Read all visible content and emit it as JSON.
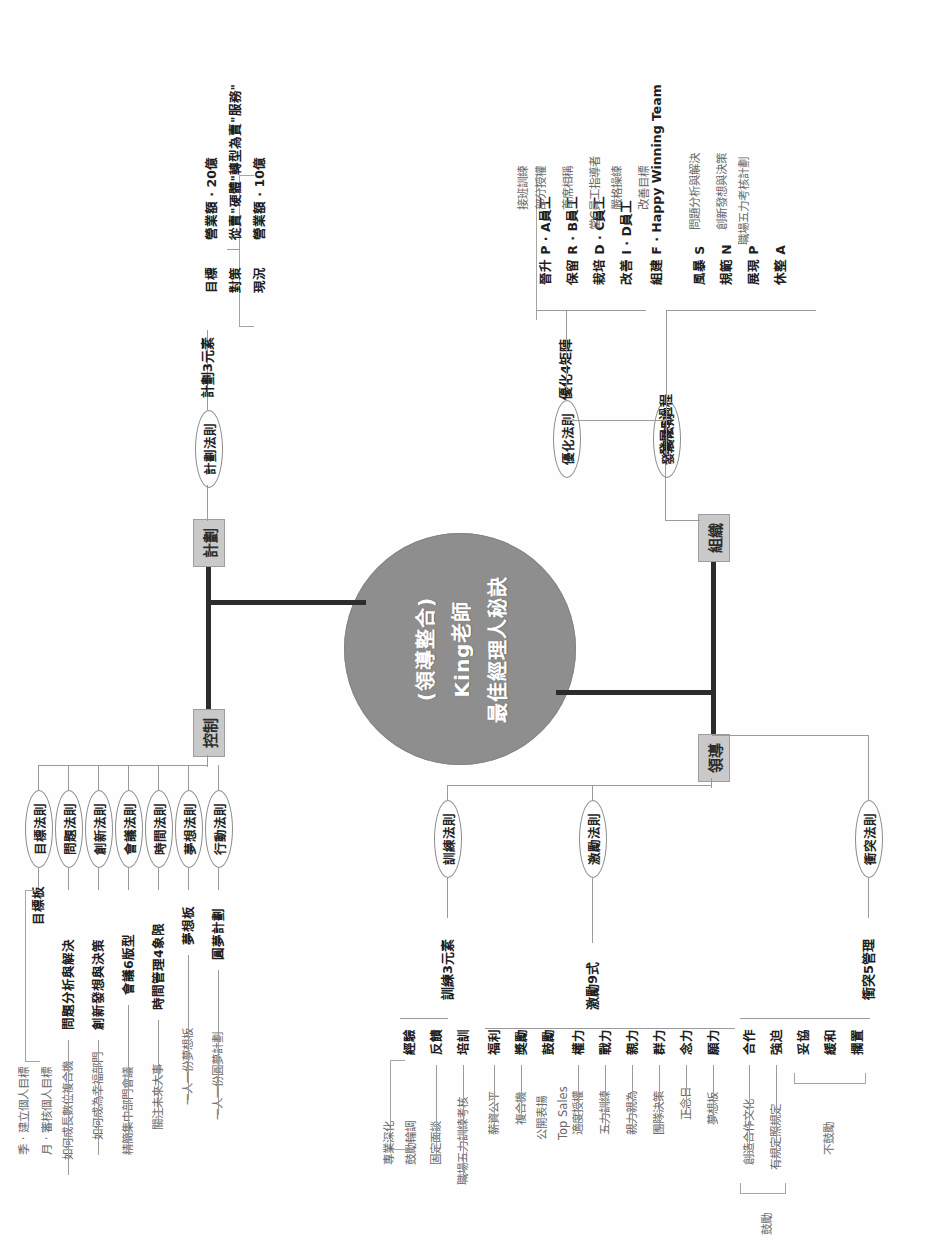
{
  "meta": {
    "title_lines": [
      "(領導整合)",
      "King老師",
      "最佳經理人秘訣"
    ],
    "center_color": "#8e8e8e",
    "category_box_color": "#c9c9c9"
  },
  "categories": {
    "plan": "計劃",
    "control": "控制",
    "organize": "組織",
    "lead": "領導"
  },
  "plan": {
    "law": "計劃法則",
    "group": "計劃3元素",
    "items": [
      {
        "label": "現況",
        "sep": "·",
        "detail": "營業額 · 10億"
      },
      {
        "label": "對策",
        "sep": "·",
        "detail": "從賣\"硬體\"轉型為賣\"服務\""
      },
      {
        "label": "目標",
        "sep": "·",
        "detail": "營業額 · 20億"
      }
    ]
  },
  "organize": {
    "laws": [
      {
        "law": "優化法則",
        "group": "優化4矩陣"
      },
      {
        "law": "發展法則",
        "group": "發展5過程"
      }
    ],
    "matrix": [
      {
        "label": "晉升 P",
        "sep": "·",
        "detail": "A員工",
        "sub": "接班訓練"
      },
      {
        "label": "",
        "sep": "",
        "detail": "",
        "sub": "部分授權"
      },
      {
        "label": "保留 R",
        "sep": "·",
        "detail": "B員工",
        "sub": "首席相稱"
      },
      {
        "label": "栽培 D",
        "sep": "·",
        "detail": "C員工",
        "sub": "當C員工指導者"
      },
      {
        "label": "改善 I",
        "sep": "·",
        "detail": "D員工",
        "sub": "嚴格操練"
      },
      {
        "label": "",
        "sep": "",
        "detail": "",
        "sub": "改善目標"
      }
    ],
    "matrix_rows": [
      {
        "main": "晉升 P · A員工",
        "subs": [
          "接班訓練",
          "部分授權"
        ]
      },
      {
        "main": "保留 R · B員工",
        "subs": [
          "首席相稱"
        ]
      },
      {
        "main": "栽培 D · C員工",
        "subs": [
          "當C員工指導者",
          "嚴格操練"
        ]
      },
      {
        "main": "改善 I · D員工",
        "subs": [
          "改善目標"
        ]
      }
    ],
    "process": [
      {
        "main": "組建 F · Happy Winning Team",
        "subs": []
      },
      {
        "main": "風暴 S",
        "subs": [
          "問題分析與解決"
        ]
      },
      {
        "main": "規範 N",
        "subs": [
          "創新發想與決策",
          "職場五力考核計劃"
        ]
      },
      {
        "main": "展現 P",
        "subs": []
      },
      {
        "main": "休整 A",
        "subs": []
      }
    ]
  },
  "control": {
    "rows": [
      {
        "law": "目標法則",
        "item": "目標板",
        "subs": [
          "季 · 建立個人目標",
          "月 · 審核個人目標"
        ]
      },
      {
        "law": "問題法則",
        "item": "問題分析與解決",
        "subs": [
          "如何成長數位複合機"
        ]
      },
      {
        "law": "創新法則",
        "item": "創新發想與決策",
        "subs": [
          "如何成為幸福部門"
        ]
      },
      {
        "law": "會議法則",
        "item": "會議6版型",
        "subs": [
          "精簡集中部門會議"
        ]
      },
      {
        "law": "時間法則",
        "item": "時間管理4象限",
        "subs": [
          "關注未來大事"
        ]
      },
      {
        "law": "夢想法則",
        "item": "夢想板",
        "subs": [
          "一人一份夢想板"
        ]
      },
      {
        "law": "行動法則",
        "item": "圓夢計劃",
        "subs": [
          "一人一份圓夢計劃"
        ]
      }
    ]
  },
  "lead": {
    "training": {
      "law": "訓練法則",
      "group": "訓練3元素",
      "rows": [
        {
          "main": "經驗",
          "subs": [
            "專業深化",
            "鼓勵輪調"
          ]
        },
        {
          "main": "反饋",
          "subs": [
            "固定面談"
          ]
        },
        {
          "main": "培訓",
          "subs": [
            "職場五力訓練考核"
          ]
        }
      ]
    },
    "motivation": {
      "law": "激勵法則",
      "group": "激勵9式",
      "rows": [
        {
          "main": "福利",
          "subs": [
            "薪資公平"
          ]
        },
        {
          "main": "獎勵",
          "subs": [
            "複合機"
          ]
        },
        {
          "main": "鼓勵",
          "subs": [
            "公開表揚",
            "Top Sales"
          ]
        },
        {
          "main": "權力",
          "subs": [
            "適度授權"
          ]
        },
        {
          "main": "戰力",
          "subs": [
            "五力訓練"
          ]
        },
        {
          "main": "親力",
          "subs": [
            "親力親為"
          ]
        },
        {
          "main": "群力",
          "subs": [
            "團隊決策"
          ]
        },
        {
          "main": "念力",
          "subs": [
            "正念日"
          ]
        },
        {
          "main": "願力",
          "subs": [
            "夢想板"
          ]
        }
      ]
    },
    "conflict": {
      "law": "衝突法則",
      "group": "衝突5管理",
      "encourage_label": "鼓勵",
      "discourage_label": "不鼓勵",
      "encouraged": [
        {
          "main": "合作",
          "subs": [
            "創造合作文化"
          ]
        },
        {
          "main": "強迫",
          "subs": [
            "有規定照規定"
          ]
        }
      ],
      "discouraged": [
        {
          "main": "妥協",
          "subs": []
        },
        {
          "main": "緩和",
          "subs": []
        },
        {
          "main": "擱置",
          "subs": []
        }
      ]
    }
  }
}
